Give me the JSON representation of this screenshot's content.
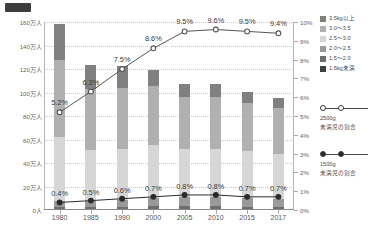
{
  "chart_data": {
    "type": "bar",
    "title": "",
    "subtitle": "",
    "xlabel": "",
    "ylabel": "",
    "categories": [
      "1980",
      "1985",
      "1990",
      "2000",
      "2005",
      "2010",
      "2015",
      "2017"
    ],
    "left_axis": {
      "ylim": [
        0,
        160
      ],
      "unit": "万人",
      "tick_labels": [
        "0人",
        "20万人",
        "40万人",
        "60万人",
        "80万人",
        "100万人",
        "120万人",
        "140万人",
        "160万人"
      ],
      "tick_values": [
        0,
        20,
        40,
        60,
        80,
        100,
        120,
        140,
        160
      ]
    },
    "right_axis": {
      "ylim": [
        0,
        10
      ],
      "unit": "%",
      "tick_labels": [
        "0%",
        "1%",
        "2%",
        "3%",
        "4%",
        "5%",
        "6%",
        "7%",
        "8%",
        "9%",
        "10%"
      ],
      "tick_values": [
        0,
        1,
        2,
        3,
        4,
        5,
        6,
        7,
        8,
        9,
        10
      ]
    },
    "grid": true,
    "legend_position": "right",
    "stacked": true,
    "series": [
      {
        "name": "3.5kg以上",
        "color": "#808080",
        "values": [
          30.0,
          20.0,
          18.0,
          14.0,
          11.5,
          11.0,
          9.5,
          8.5
        ]
      },
      {
        "name": "3.0～3.5",
        "color": "#b0b0b0",
        "values": [
          66.0,
          52.0,
          52.0,
          50.0,
          44.0,
          44.0,
          41.0,
          39.0
        ]
      },
      {
        "name": "2.5～3.0",
        "color": "#d6d6d6",
        "values": [
          54.0,
          44.0,
          44.0,
          45.0,
          41.0,
          41.0,
          40.0,
          38.0
        ]
      },
      {
        "name": "2.0～2.5",
        "color": "#9a9a9a",
        "values": [
          5.5,
          5.0,
          5.5,
          7.5,
          8.0,
          8.0,
          7.5,
          7.0
        ]
      },
      {
        "name": "1.5～2.0",
        "color": "#6e6e6e",
        "values": [
          1.8,
          1.6,
          1.8,
          2.0,
          2.0,
          2.0,
          1.8,
          1.7
        ]
      },
      {
        "name": "1.5kg未満",
        "color": "#3f3f3f",
        "values": [
          0.7,
          0.8,
          0.9,
          1.0,
          1.0,
          1.0,
          0.9,
          0.8
        ]
      }
    ],
    "lines": [
      {
        "name": "2500g未満児の割合",
        "marker": "open-circle",
        "color": "#555555",
        "axis": "right",
        "values": [
          5.2,
          6.3,
          7.5,
          8.6,
          9.5,
          9.6,
          9.5,
          9.4
        ],
        "labels": [
          "5.2%",
          "6.3%",
          "7.5%",
          "8.6%",
          "9.5%",
          "9.6%",
          "9.5%",
          "9.4%"
        ]
      },
      {
        "name": "1500g未満児の割合",
        "marker": "filled-circle",
        "color": "#2b2b2b",
        "axis": "right",
        "values": [
          0.4,
          0.5,
          0.6,
          0.7,
          0.8,
          0.8,
          0.7,
          0.7
        ],
        "labels": [
          "0.4%",
          "0.5%",
          "0.6%",
          "0.7%",
          "0.8%",
          "0.8%",
          "0.7%",
          "0.7%"
        ]
      }
    ],
    "bar_totals": [
      158.0,
      123.4,
      122.2,
      119.5,
      107.5,
      107.0,
      100.7,
      95.0
    ]
  },
  "legend": {
    "stack_title": "",
    "line_items": [
      {
        "label_line1": "2500g",
        "label_line2": "未満児の割合",
        "marker": "open-circle"
      },
      {
        "label_line1": "1500g",
        "label_line2": "未満児の割合",
        "marker": "filled-circle"
      }
    ]
  }
}
